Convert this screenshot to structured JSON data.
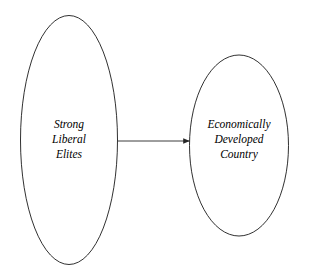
{
  "canvas": {
    "width": 309,
    "height": 277,
    "background": "#ffffff"
  },
  "style": {
    "stroke_color": "#1a1a1a",
    "text_color": "#000000",
    "stroke_width": 0.9,
    "arrow_color": "#262626"
  },
  "diagram": {
    "type": "causal-flow",
    "nodes": [
      {
        "id": "strong-liberal-elites",
        "shape": "ellipse",
        "cx": 69,
        "cy": 140,
        "rx": 48.5,
        "ry": 124.5,
        "lines": [
          "Strong",
          "Liberal",
          "Elites"
        ]
      },
      {
        "id": "economically-developed-country",
        "shape": "ellipse",
        "cx": 239,
        "cy": 145.5,
        "rx": 49.5,
        "ry": 90.5,
        "lines": [
          "Economically",
          "Developed",
          "Country"
        ]
      }
    ],
    "edges": [
      {
        "id": "elites-to-country",
        "from": "strong-liberal-elites",
        "to": "economically-developed-country",
        "label": "",
        "x1": 118,
        "y1": 141,
        "x2": 190,
        "y2": 141,
        "arrowhead": "solid-triangle"
      }
    ]
  },
  "labels": {
    "left": {
      "line1": "Strong",
      "line2": "Liberal",
      "line3": "Elites"
    },
    "right": {
      "line1": "Economically",
      "line2": "Developed",
      "line3": "Country"
    }
  }
}
